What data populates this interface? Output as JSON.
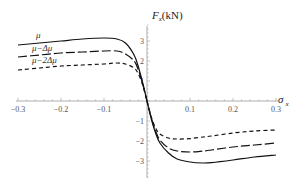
{
  "chart_data": {
    "type": "line",
    "title": "",
    "xlabel": "σx",
    "ylabel": "Fx(kN)",
    "xlim": [
      -0.3,
      0.3
    ],
    "ylim": [
      -3.5,
      3.5
    ],
    "grid": false,
    "legend_position": "inline, upper-left (labels above each curve)",
    "x_ticks": [
      -0.3,
      -0.2,
      -0.1,
      0.1,
      0.2,
      0.3
    ],
    "x_tick_labels": [
      "−0.3",
      "−0.2",
      "−0.1",
      "0.1",
      "0.2",
      "0.3"
    ],
    "y_ticks": [
      -3,
      -2,
      -1,
      1,
      2,
      3
    ],
    "y_tick_labels": [
      "−3",
      "−2",
      "−1",
      "1",
      "2",
      "3"
    ],
    "x": [
      -0.3,
      -0.25,
      -0.2,
      -0.15,
      -0.1,
      -0.07,
      -0.05,
      -0.03,
      -0.02,
      -0.01,
      0,
      0.01,
      0.02,
      0.03,
      0.05,
      0.07,
      0.1,
      0.13,
      0.15,
      0.2,
      0.25,
      0.3
    ],
    "series": [
      {
        "name": "μ",
        "style": "solid",
        "values": [
          2.8,
          2.9,
          3.0,
          3.1,
          3.15,
          3.1,
          2.9,
          2.3,
          1.7,
          0.9,
          0,
          -0.9,
          -1.6,
          -2.1,
          -2.6,
          -2.9,
          -3.05,
          -3.1,
          -3.08,
          -2.95,
          -2.8,
          -2.7
        ]
      },
      {
        "name": "μ−Δμ",
        "style": "long-dash",
        "values": [
          2.2,
          2.3,
          2.4,
          2.45,
          2.5,
          2.5,
          2.35,
          2.0,
          1.55,
          0.85,
          0,
          -0.85,
          -1.5,
          -1.95,
          -2.35,
          -2.5,
          -2.55,
          -2.5,
          -2.45,
          -2.3,
          -2.2,
          -2.1
        ]
      },
      {
        "name": "μ−2Δμ",
        "style": "short-dash",
        "values": [
          1.55,
          1.65,
          1.75,
          1.8,
          1.85,
          1.9,
          1.85,
          1.65,
          1.35,
          0.8,
          0,
          -0.8,
          -1.35,
          -1.65,
          -1.85,
          -1.9,
          -1.88,
          -1.8,
          -1.75,
          -1.6,
          -1.5,
          -1.45
        ]
      }
    ]
  },
  "labels": {
    "y_axis_symbol": "F",
    "y_axis_subscript": "x",
    "y_axis_unit": "(kN)",
    "x_axis_symbol": "σ",
    "x_axis_subscript": "x",
    "legend": [
      "μ",
      "μ−Δμ",
      "μ−2Δμ"
    ]
  }
}
